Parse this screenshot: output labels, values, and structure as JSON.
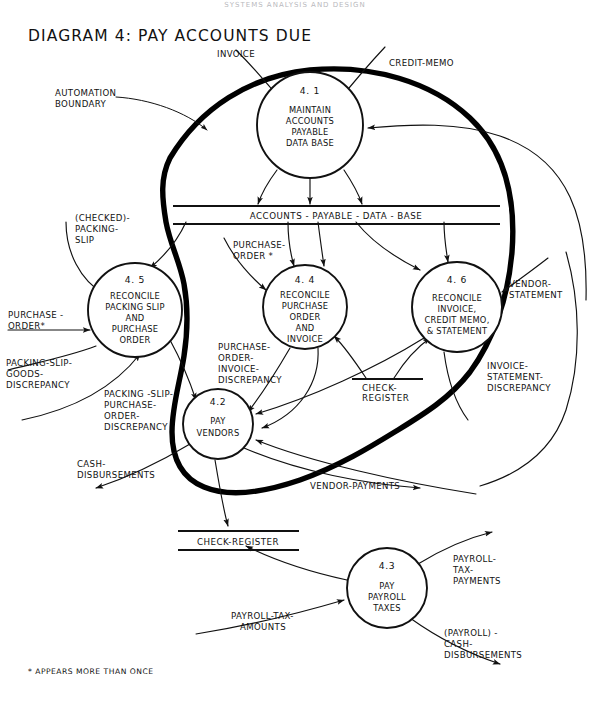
{
  "page": {
    "top_header": "SYSTEMS ANALYSIS AND DESIGN",
    "title": "DIAGRAM 4:  PAY ACCOUNTS DUE",
    "footnote": "* APPEARS MORE THAN ONCE"
  },
  "boundary": {
    "label_line1": "AUTOMATION",
    "label_line2": "BOUNDARY"
  },
  "processes": [
    {
      "id": "4.1",
      "number": "4. 1",
      "name_lines": [
        "MAINTAIN",
        "ACCOUNTS",
        "PAYABLE",
        "DATA BASE"
      ],
      "cx": 310,
      "cy": 125,
      "r": 53
    },
    {
      "id": "4.5",
      "number": "4. 5",
      "name_lines": [
        "RECONCILE",
        "PACKING SLIP",
        "AND",
        "PURCHASE",
        "ORDER"
      ],
      "cx": 135,
      "cy": 310,
      "r": 47
    },
    {
      "id": "4.4",
      "number": "4. 4",
      "name_lines": [
        "RECONCILE",
        "PURCHASE",
        "ORDER",
        "AND",
        "INVOICE"
      ],
      "cx": 305,
      "cy": 307,
      "r": 42
    },
    {
      "id": "4.6",
      "number": "4. 6",
      "name_lines": [
        "RECONCILE",
        "INVOICE,",
        "CREDIT MEMO,",
        "& STATEMENT"
      ],
      "cx": 457,
      "cy": 307,
      "r": 45
    },
    {
      "id": "4.2",
      "number": "4.2",
      "name_lines": [
        "PAY",
        "VENDORS"
      ],
      "cx": 218,
      "cy": 424,
      "r": 35
    },
    {
      "id": "4.3",
      "number": "4.3",
      "number_alt": "4. 3",
      "name_lines": [
        "PAY",
        "PAYROLL",
        "TAXES"
      ],
      "cx": 387,
      "cy": 588,
      "r": 40
    }
  ],
  "data_stores": [
    {
      "id": "accounts-payable-data-base",
      "label": "ACCOUNTS - PAYABLE - DATA - BASE",
      "style": "double",
      "x1": 173,
      "x2": 500,
      "y": 212
    },
    {
      "id": "check-register-upper",
      "label": "CHECK- REGISTER",
      "label_line1": "CHECK-",
      "label_line2": "REGISTER",
      "style": "single",
      "x1": 354,
      "x2": 421,
      "y": 382
    },
    {
      "id": "check-register-lower",
      "label": "CHECK-REGISTER",
      "style": "double",
      "x1": 178,
      "x2": 299,
      "y": 537
    }
  ],
  "flows": [
    {
      "id": "invoice",
      "label": "INVOICE",
      "lines": [
        "INVOICE"
      ]
    },
    {
      "id": "credit-memo",
      "label": "CREDIT-MEMO",
      "lines": [
        "CREDIT-MEMO"
      ]
    },
    {
      "id": "checked-packing-slip",
      "label": "(CHECKED)-PACKING-SLIP",
      "lines": [
        "(CHECKED)-",
        "PACKING-",
        "SLIP"
      ]
    },
    {
      "id": "purchase-order-4-4",
      "label": "PURCHASE-ORDER *",
      "lines": [
        "PURCHASE-",
        "ORDER *"
      ]
    },
    {
      "id": "vendor-statement",
      "label": "VENDOR-STATEMENT",
      "lines": [
        "VENDOR-",
        "STATEMENT"
      ]
    },
    {
      "id": "purchase-order-4-5",
      "label": "PURCHASE-ORDER*",
      "lines": [
        "PURCHASE -",
        "ORDER*"
      ]
    },
    {
      "id": "packing-slip-goods-discrepancy",
      "label": "PACKING-SLIP-GOODS-DISCREPANCY",
      "lines": [
        "PACKING-SLIP-",
        "GOODS-",
        "DISCREPANCY"
      ]
    },
    {
      "id": "packing-slip-purchase-order-discrepancy",
      "label": "PACKING-SLIP-PURCHASE-ORDER-DISCREPANCY",
      "lines": [
        "PACKING -SLIP-",
        "PURCHASE-",
        "ORDER-",
        "DISCREPANCY"
      ]
    },
    {
      "id": "purchase-order-invoice-discrepancy",
      "label": "PURCHASE-ORDER-INVOICE-DISCREPANCY",
      "lines": [
        "PURCHASE-",
        "ORDER-",
        "INVOICE-",
        "DISCREPANCY"
      ]
    },
    {
      "id": "invoice-statement-discrepancy",
      "label": "INVOICE-STATEMENT-DISCREPANCY",
      "lines": [
        "INVOICE-",
        "STATEMENT-",
        "DISCREPANCY"
      ]
    },
    {
      "id": "cash-disbursements",
      "label": "CASH-DISBURSEMENTS",
      "lines": [
        "CASH-",
        "DISBURSEMENTS"
      ]
    },
    {
      "id": "vendor-payments",
      "label": "VENDOR-PAYMENTS",
      "lines": [
        "VENDOR-PAYMENTS"
      ]
    },
    {
      "id": "payroll-tax-payments",
      "label": "PAYROLL-TAX-PAYMENTS",
      "lines": [
        "PAYROLL-",
        "TAX-",
        "PAYMENTS"
      ]
    },
    {
      "id": "payroll-tax-amounts",
      "label": "PAYROLL-TAX-AMOUNTS",
      "lines": [
        "PAYROLL-TAX-",
        "AMOUNTS"
      ]
    },
    {
      "id": "payroll-cash-disbursements",
      "label": "(PAYROLL)-CASH-DISBURSEMENTS",
      "lines": [
        "(PAYROLL) -",
        "CASH-",
        "DISBURSEMENTS"
      ]
    }
  ],
  "colors": {
    "ink": "#111111",
    "boundary": "#000000",
    "paper": "#ffffff"
  }
}
